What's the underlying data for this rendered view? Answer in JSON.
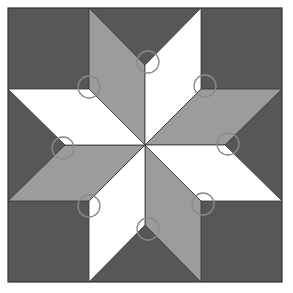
{
  "diagram": {
    "colors": {
      "background": "#575757",
      "light_diamond": "#ffffff",
      "mid_diamond": "#9c9c9c",
      "outline": "#333333",
      "marker": "#8a8a8a"
    },
    "square": {
      "x": 8,
      "y": 8,
      "size": 274
    },
    "corner_squares": [
      {
        "x": 8,
        "y": 8,
        "size": 81
      },
      {
        "x": 201,
        "y": 8,
        "size": 81
      },
      {
        "x": 8,
        "y": 201,
        "size": 81
      },
      {
        "x": 201,
        "y": 201,
        "size": 81
      }
    ],
    "diamonds": [
      {
        "name": "diamond-top-left",
        "fill": "mid",
        "points": "145,145 89,89 89,8 145,65"
      },
      {
        "name": "diamond-top-right",
        "fill": "light",
        "points": "145,145 145,65 201,8 201,89"
      },
      {
        "name": "diamond-right-upper",
        "fill": "mid",
        "points": "145,145 201,89 282,89 225,145"
      },
      {
        "name": "diamond-right-lower",
        "fill": "light",
        "points": "145,145 225,145 282,201 201,201"
      },
      {
        "name": "diamond-bottom-right",
        "fill": "mid",
        "points": "145,145 201,201 201,282 145,225"
      },
      {
        "name": "diamond-bottom-left",
        "fill": "light",
        "points": "145,145 145,225 89,282 89,201"
      },
      {
        "name": "diamond-left-lower",
        "fill": "mid",
        "points": "145,145 89,201 8,201 65,145"
      },
      {
        "name": "diamond-left-upper",
        "fill": "light",
        "points": "145,145 65,145 8,89 89,89"
      }
    ],
    "markers": [
      {
        "cx": 148,
        "cy": 62,
        "r": 11
      },
      {
        "cx": 89,
        "cy": 87,
        "r": 11
      },
      {
        "cx": 205,
        "cy": 86,
        "r": 11
      },
      {
        "cx": 228,
        "cy": 144,
        "r": 11
      },
      {
        "cx": 203,
        "cy": 204,
        "r": 11
      },
      {
        "cx": 148,
        "cy": 229,
        "r": 11
      },
      {
        "cx": 89,
        "cy": 206,
        "r": 11
      },
      {
        "cx": 63,
        "cy": 148,
        "r": 11
      }
    ]
  }
}
